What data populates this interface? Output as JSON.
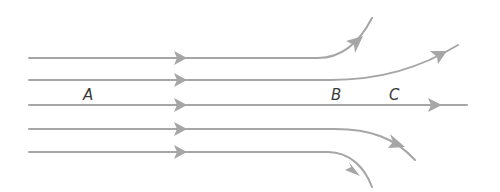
{
  "diagram": {
    "type": "streamlines",
    "line_color": "#a6a6a6",
    "label_color": "#3a3a3a",
    "labels": [
      {
        "id": "A",
        "text": "A",
        "x": 87,
        "y": 100
      },
      {
        "id": "B",
        "text": "B",
        "x": 335,
        "y": 100
      },
      {
        "id": "C",
        "text": "C",
        "x": 393,
        "y": 100
      }
    ],
    "streamlines": [
      {
        "id": "line-1",
        "start_y": 58,
        "behavior": "curves sharply up",
        "end": [
          372,
          18
        ]
      },
      {
        "id": "line-2",
        "start_y": 80,
        "behavior": "curves gently up",
        "end": [
          458,
          45
        ]
      },
      {
        "id": "line-3",
        "start_y": 105,
        "behavior": "straight",
        "end": [
          467,
          105
        ]
      },
      {
        "id": "line-4",
        "start_y": 129,
        "behavior": "curves gently down",
        "end": [
          415,
          160
        ]
      },
      {
        "id": "line-5",
        "start_y": 152,
        "behavior": "curves sharply down",
        "end": [
          372,
          187
        ]
      }
    ]
  }
}
